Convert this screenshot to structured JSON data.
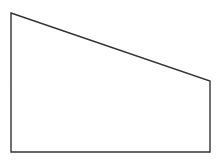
{
  "diagram": {
    "shape": "trapezoid",
    "stroke_color": "#333333",
    "fill_color": "#ffffff",
    "stroke_width": 1.4,
    "vertices": [
      {
        "x": 11,
        "y": 13
      },
      {
        "x": 210,
        "y": 81
      },
      {
        "x": 210,
        "y": 152
      },
      {
        "x": 11,
        "y": 152
      }
    ]
  }
}
